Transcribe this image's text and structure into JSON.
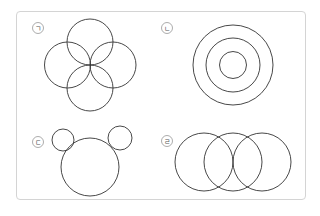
{
  "figures": [
    {
      "label": "ㄱ",
      "description": "four overlapping circles arranged in a cross (flower)",
      "label_pos": [
        38,
        28
      ],
      "circles": [
        [
          90,
          42,
          23
        ],
        [
          67.5,
          65,
          23
        ],
        [
          113,
          65,
          23
        ],
        [
          90,
          88,
          23
        ]
      ]
    },
    {
      "label": "ㄴ",
      "description": "three concentric circles",
      "label_pos": [
        167,
        28
      ],
      "circles": [
        [
          233,
          65,
          40
        ],
        [
          233,
          65,
          27
        ],
        [
          233,
          65,
          13.5
        ]
      ]
    },
    {
      "label": "ㄷ",
      "description": "one large circle with two small ear circles (mouse shape)",
      "label_pos": [
        38,
        142
      ],
      "circles": [
        [
          90,
          167,
          29
        ],
        [
          63,
          140,
          11
        ],
        [
          120,
          138,
          12
        ]
      ]
    },
    {
      "label": "ㄹ",
      "description": "three overlapping circles in a row",
      "label_pos": [
        167,
        141
      ],
      "circles": [
        [
          204,
          162,
          29
        ],
        [
          233,
          162,
          29
        ],
        [
          262,
          162,
          29
        ]
      ]
    }
  ],
  "colors": {
    "stroke": "#333333",
    "frame": "#d4d4d4",
    "label": "#555555"
  }
}
